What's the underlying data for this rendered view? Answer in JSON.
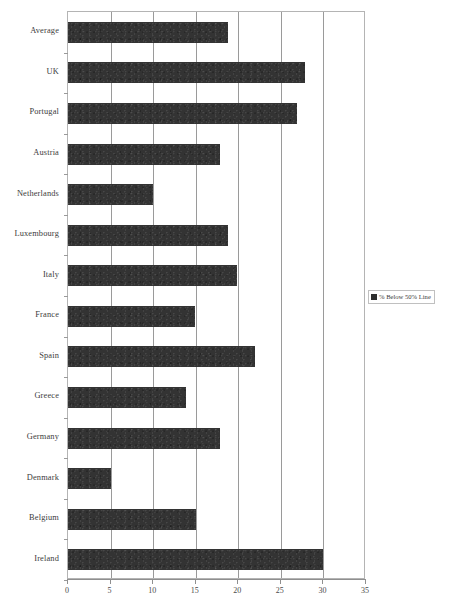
{
  "chart_data": {
    "type": "bar",
    "orientation": "horizontal",
    "title": "",
    "subtitle": "",
    "xlabel": "",
    "ylabel": "",
    "xlim": [
      0,
      35
    ],
    "xticks": [
      0,
      5,
      10,
      15,
      20,
      25,
      30,
      35
    ],
    "xtick_labels": [
      "0",
      "5",
      "10",
      "15",
      "20",
      "25",
      "30",
      "35"
    ],
    "grid": true,
    "grid_axis": "x",
    "legend": {
      "position": "right",
      "entries": [
        {
          "label": "% Below 50% Line",
          "color": "#2e2e2e"
        }
      ]
    },
    "series": [
      {
        "name": "% Below 50% Line",
        "color": "#333333",
        "values": [
          18.8,
          27.8,
          26.9,
          17.8,
          10.0,
          18.8,
          19.8,
          14.9,
          22.0,
          13.9,
          17.8,
          5.1,
          15.0,
          30.0
        ]
      }
    ],
    "categories": [
      "Average",
      "UK",
      "Portugal",
      "Austria",
      "Netherlands",
      "Luxembourg",
      "Italy",
      "France",
      "Spain",
      "Greece",
      "Germany",
      "Denmark",
      "Belgium",
      "Ireland"
    ]
  },
  "colors": {
    "bar": "#333333",
    "grid": "#9a9a9a",
    "axis": "#8f8f8f",
    "plot_border": "#b4b4b4",
    "text": "#3c3c3c",
    "background": "#ffffff"
  }
}
